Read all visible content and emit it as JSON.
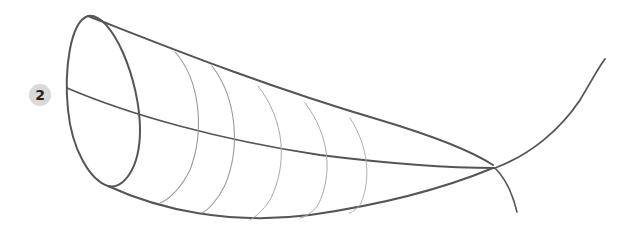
{
  "figure": {
    "step_number": "2",
    "colors": {
      "background": "#ffffff",
      "stroke_dark": "#555555",
      "stroke_light": "#9a9a9a",
      "badge_fill": "#d9d9d9",
      "badge_text": "#222222"
    }
  }
}
